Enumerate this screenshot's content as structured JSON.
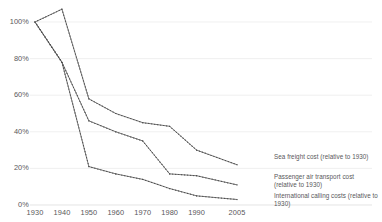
{
  "chart_data": {
    "type": "line",
    "title": "",
    "subtitle": "",
    "xlabel": "",
    "ylabel": "",
    "x": [
      1930,
      1940,
      1950,
      1960,
      1970,
      1980,
      1990,
      2005
    ],
    "xtick_labels": [
      "1930",
      "1940",
      "1950",
      "1960",
      "1970",
      "1980",
      "1990",
      "2005"
    ],
    "ytick_labels": [
      "0%",
      "20%",
      "40%",
      "60%",
      "80%",
      "100%"
    ],
    "ytick_values": [
      0,
      20,
      40,
      60,
      80,
      100
    ],
    "ylim": [
      0,
      112
    ],
    "xlim": [
      1930,
      2005
    ],
    "grid": "horizontal-only",
    "legend_position": "inline-right-of-line-end",
    "marker": "small-dot",
    "line_style": "dotted",
    "series": [
      {
        "name": "Sea freight cost (relative to 1930)",
        "label_short": "sea-freight",
        "color": "#5c5c5c",
        "values": [
          100,
          107,
          58,
          50,
          45,
          43,
          30,
          22
        ]
      },
      {
        "name": "Passenger air transport cost (relative to 1930)",
        "label_short": "passenger-air-transport",
        "color": "#5c5c5c",
        "values": [
          100,
          78,
          46,
          40,
          35,
          17,
          16,
          11
        ]
      },
      {
        "name": "International calling costs (relative to 1930)",
        "label_short": "international-calling",
        "color": "#5c5c5c",
        "values": [
          100,
          78,
          21,
          17,
          14,
          9,
          5,
          3
        ]
      }
    ]
  },
  "labels": {
    "sea_freight": "Sea freight cost (relative to 1930)",
    "passenger_air": "Passenger air transport cost (relative to 1930)",
    "international_calling": "International calling costs (relative to 1930)"
  }
}
